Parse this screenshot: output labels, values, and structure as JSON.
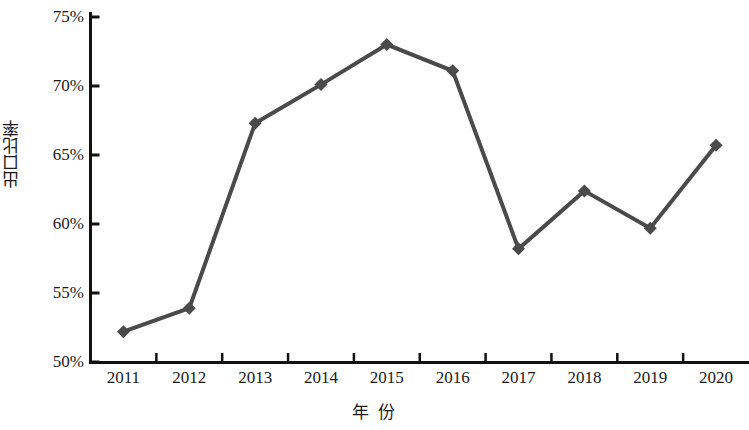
{
  "chart_data": {
    "type": "line",
    "title": "",
    "subtitle": "",
    "xlabel": "年  份",
    "ylabel": "出口比率",
    "categories": [
      "2011",
      "2012",
      "2013",
      "2014",
      "2015",
      "2016",
      "2017",
      "2018",
      "2019",
      "2020"
    ],
    "values": [
      52.2,
      53.9,
      67.3,
      70.1,
      73.0,
      71.1,
      58.2,
      62.4,
      59.7,
      65.7
    ],
    "series": [
      {
        "name": "出口比率",
        "values": [
          52.2,
          53.9,
          67.3,
          70.1,
          73.0,
          71.1,
          58.2,
          62.4,
          59.7,
          65.7
        ]
      }
    ],
    "ylim": [
      50,
      75
    ],
    "ytick_values": [
      50,
      55,
      60,
      65,
      70,
      75
    ],
    "ytick_labels": [
      "50%",
      "55%",
      "60%",
      "65%",
      "70%",
      "75%"
    ],
    "xtick_labels": [
      "2011",
      "2012",
      "2013",
      "2014",
      "2015",
      "2016",
      "2017",
      "2018",
      "2019",
      "2020"
    ],
    "grid": false,
    "legend": false,
    "legend_position": "none",
    "marker": "diamond",
    "line_color": "#4a4a4a",
    "marker_color": "#4a4a4a",
    "axis_color": "#111111",
    "background_color": "#ffffff",
    "annotations": []
  },
  "axes": {
    "y_title": "出口比率",
    "x_title": "年  份"
  }
}
